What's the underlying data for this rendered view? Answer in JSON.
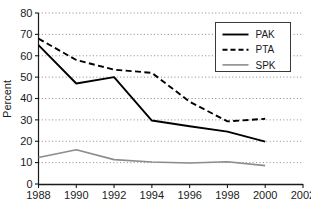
{
  "chart_data": {
    "type": "line",
    "title": "",
    "xlabel": "",
    "ylabel": "Percent",
    "xlim": [
      1988,
      2002
    ],
    "ylim": [
      0,
      80
    ],
    "grid": true,
    "grid_style": "dotted-horizontal",
    "legend_position": "top-right",
    "x": [
      1988,
      1990,
      1992,
      1994,
      1996,
      1998,
      2000
    ],
    "xticks": [
      "1988",
      "1990",
      "1992",
      "1994",
      "1996",
      "1998",
      "2000",
      "2002"
    ],
    "xtick_values": [
      1988,
      1990,
      1992,
      1994,
      1996,
      1998,
      2000,
      2002
    ],
    "yticks": [
      "0",
      "10",
      "20",
      "30",
      "40",
      "50",
      "60",
      "70",
      "80"
    ],
    "ytick_values": [
      0,
      10,
      20,
      30,
      40,
      50,
      60,
      70,
      80
    ],
    "series": [
      {
        "name": "PAK",
        "style": "solid",
        "color": "#000000",
        "width": 1.9,
        "values": [
          65,
          47,
          50,
          29.7,
          27,
          24.5,
          19.8
        ]
      },
      {
        "name": "PTA",
        "style": "dashed",
        "color": "#000000",
        "width": 1.9,
        "values": [
          68,
          58,
          53.5,
          52,
          38.5,
          29.3,
          30.5
        ]
      },
      {
        "name": "SPK",
        "style": "solid",
        "color": "#8c8c8c",
        "width": 1.6,
        "values": [
          12.4,
          16,
          11.4,
          10.3,
          9.8,
          10.4,
          8.6
        ]
      }
    ]
  },
  "legend": {
    "entries": [
      {
        "label": "PAK"
      },
      {
        "label": "PTA"
      },
      {
        "label": "SPK"
      }
    ]
  },
  "axes": {
    "y_title": "Percent"
  }
}
